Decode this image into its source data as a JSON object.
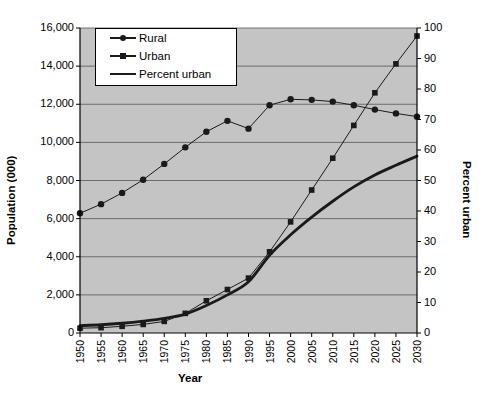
{
  "chart_data": {
    "type": "line",
    "title": "",
    "xlabel": "Year",
    "ylabel": "Population (000)",
    "y2label": "Percent urban",
    "categories": [
      1950,
      1955,
      1960,
      1965,
      1970,
      1975,
      1980,
      1985,
      1990,
      1995,
      2000,
      2005,
      2010,
      2015,
      2020,
      2025,
      2030
    ],
    "x": [
      "1950",
      "1955",
      "1960",
      "1965",
      "1970",
      "1975",
      "1980",
      "1985",
      "1990",
      "1995",
      "2000",
      "2005",
      "2010",
      "2015",
      "2020",
      "2025",
      "2030"
    ],
    "ylim": [
      0,
      16000
    ],
    "yticks": [
      "0",
      "2,000",
      "4,000",
      "6,000",
      "8,000",
      "10,000",
      "12,000",
      "14,000",
      "16,000"
    ],
    "ytick_values": [
      0,
      2000,
      4000,
      6000,
      8000,
      10000,
      12000,
      14000,
      16000
    ],
    "y2lim": [
      0,
      100
    ],
    "y2ticks": [
      "0",
      "10",
      "20",
      "30",
      "40",
      "50",
      "60",
      "70",
      "80",
      "90",
      "100"
    ],
    "y2tick_values": [
      0,
      10,
      20,
      30,
      40,
      50,
      60,
      70,
      80,
      90,
      100
    ],
    "grid": true,
    "legend_position": "upper-left-inside",
    "plot_bgcolor": "#c4c4c4",
    "series": [
      {
        "name": "Rural",
        "axis": "left",
        "marker": "circle",
        "color": "#1a1a1a",
        "values": [
          6280,
          6760,
          7350,
          8040,
          8870,
          9740,
          10560,
          11130,
          10720,
          11950,
          12260,
          12230,
          12140,
          11950,
          11720,
          11520,
          11350
        ]
      },
      {
        "name": "Urban",
        "axis": "left",
        "marker": "square",
        "color": "#1a1a1a",
        "values": [
          250,
          280,
          350,
          450,
          610,
          1030,
          1690,
          2280,
          2880,
          4260,
          5830,
          7500,
          9170,
          10890,
          12600,
          14120,
          15580
        ]
      },
      {
        "name": "Percent urban",
        "axis": "right",
        "marker": "none",
        "color": "#1a1a1a",
        "values": [
          2.4,
          2.7,
          3.2,
          3.9,
          4.8,
          6.2,
          9.0,
          12.5,
          16.8,
          25.5,
          32.2,
          38.0,
          43.2,
          47.9,
          51.8,
          55.0,
          58.0
        ]
      }
    ],
    "legend": [
      "Rural",
      "Urban",
      "Percent urban"
    ]
  },
  "axes": {
    "left_title": "Population (000)",
    "right_title": "Percent urban",
    "bottom_title": "Year"
  }
}
